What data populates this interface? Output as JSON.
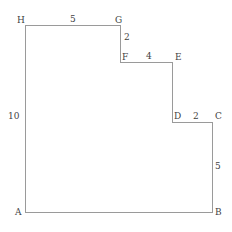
{
  "figure": {
    "type": "geometry-diagram",
    "shape_name": "staircase-polygon",
    "canvas": {
      "width": 232,
      "height": 232
    },
    "stroke_color": "#9a9a9a",
    "text_color": "#3f3f3f",
    "background_color": "#ffffff",
    "outline_path": "M25,25 L120,25 L120,62 L172,62 L172,122 L212,122 L212,212 L25,212 Z",
    "vertices": [
      {
        "id": "A",
        "label": "A",
        "x": 25,
        "y": 212,
        "label_x": 15,
        "label_y": 207
      },
      {
        "id": "B",
        "label": "B",
        "x": 212,
        "y": 212,
        "label_x": 215,
        "label_y": 207
      },
      {
        "id": "C",
        "label": "C",
        "x": 212,
        "y": 122,
        "label_x": 215,
        "label_y": 111
      },
      {
        "id": "D",
        "label": "D",
        "x": 172,
        "y": 122,
        "label_x": 174,
        "label_y": 111
      },
      {
        "id": "E",
        "label": "E",
        "x": 172,
        "y": 62,
        "label_x": 175,
        "label_y": 52
      },
      {
        "id": "F",
        "label": "F",
        "x": 120,
        "y": 62,
        "label_x": 122,
        "label_y": 52
      },
      {
        "id": "G",
        "label": "G",
        "x": 120,
        "y": 25,
        "label_x": 115,
        "label_y": 15
      },
      {
        "id": "H",
        "label": "H",
        "x": 25,
        "y": 25,
        "label_x": 17,
        "label_y": 15
      }
    ],
    "dimensions": [
      {
        "id": "HG",
        "label": "5",
        "segment": "H-G",
        "orientation": "horizontal",
        "label_x": 70,
        "label_y": 14
      },
      {
        "id": "GF",
        "label": "2",
        "segment": "G-F",
        "orientation": "vertical",
        "label_x": 124,
        "label_y": 32
      },
      {
        "id": "FE",
        "label": "4",
        "segment": "F-E",
        "orientation": "horizontal",
        "label_x": 146,
        "label_y": 51
      },
      {
        "id": "DC",
        "label": "2",
        "segment": "D-C",
        "orientation": "horizontal",
        "label_x": 193,
        "label_y": 111
      },
      {
        "id": "CB",
        "label": "5",
        "segment": "C-B",
        "orientation": "vertical",
        "label_x": 215,
        "label_y": 161
      },
      {
        "id": "HA",
        "label": "10",
        "segment": "H-A",
        "orientation": "vertical",
        "label_x": 8,
        "label_y": 111
      }
    ]
  }
}
